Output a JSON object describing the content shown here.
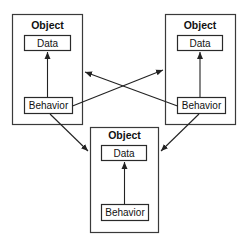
{
  "diagram": {
    "objects": [
      {
        "id": "top-left",
        "title": "Object",
        "data_label": "Data",
        "behavior_label": "Behavior"
      },
      {
        "id": "top-right",
        "title": "Object",
        "data_label": "Data",
        "behavior_label": "Behavior"
      },
      {
        "id": "bottom",
        "title": "Object",
        "data_label": "Data",
        "behavior_label": "Behavior"
      }
    ],
    "connections": [
      {
        "from": "top-left.behavior",
        "to": "top-left.data"
      },
      {
        "from": "top-right.behavior",
        "to": "top-right.data"
      },
      {
        "from": "bottom.behavior",
        "to": "bottom.data"
      },
      {
        "from": "top-left.behavior",
        "to": "top-right"
      },
      {
        "from": "top-right.behavior",
        "to": "top-left"
      },
      {
        "from": "top-left.behavior",
        "to": "bottom"
      },
      {
        "from": "top-right.behavior",
        "to": "bottom"
      }
    ],
    "colors": {
      "stroke": "#2a2a2a",
      "background": "#ffffff"
    }
  }
}
